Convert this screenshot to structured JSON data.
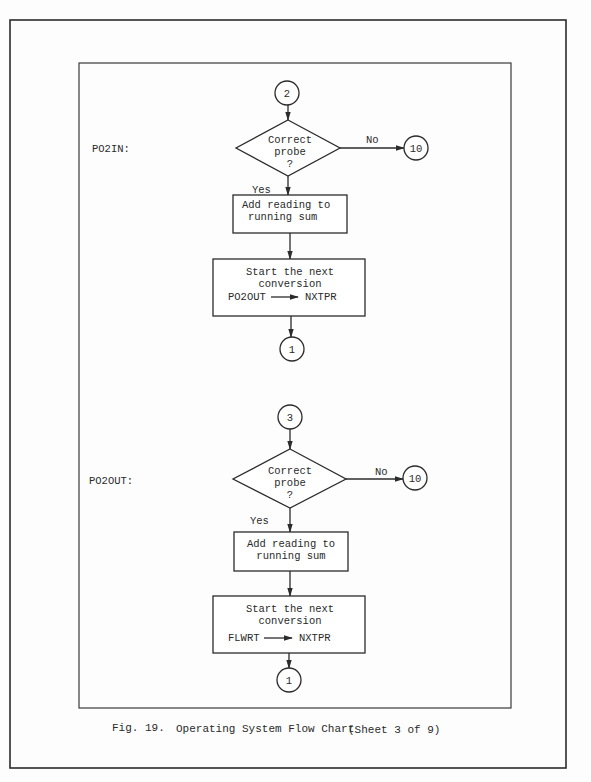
{
  "caption": {
    "figure": "Fig. 19.",
    "title": "Operating System Flow Chart",
    "sheet": "(Sheet 3 of 9)"
  },
  "sections": [
    {
      "label": "PO2IN:",
      "entry_connector": "2",
      "decision": {
        "line1": "Correct",
        "line2": "probe",
        "line3": "?"
      },
      "no_label": "No",
      "no_connector": "10",
      "yes_label": "Yes",
      "process1": {
        "line1": "Add reading to",
        "line2": "running sum"
      },
      "process2": {
        "line1": "Start the next",
        "line2": "conversion",
        "from": "PO2OUT",
        "to": "NXTPR"
      },
      "exit_connector": "1"
    },
    {
      "label": "PO2OUT:",
      "entry_connector": "3",
      "decision": {
        "line1": "Correct",
        "line2": "probe",
        "line3": "?"
      },
      "no_label": "No",
      "no_connector": "10",
      "yes_label": "Yes",
      "process1": {
        "line1": "Add reading to",
        "line2": "running sum"
      },
      "process2": {
        "line1": "Start the next",
        "line2": "conversion",
        "from": "FLWRT",
        "to": "NXTPR"
      },
      "exit_connector": "1"
    }
  ]
}
